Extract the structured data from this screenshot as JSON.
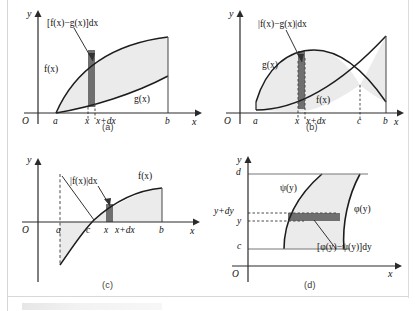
{
  "figure": {
    "panels": [
      {
        "id": "a",
        "caption": "(a)",
        "axes": {
          "y": "y",
          "x": "x",
          "origin": "O"
        },
        "ticks": [
          "a",
          "x",
          "x+dx",
          "b"
        ],
        "curve_labels": [
          "f(x)",
          "g(x)"
        ],
        "strip_label": "[f(x)−g(x)]dx"
      },
      {
        "id": "b",
        "caption": "(b)",
        "axes": {
          "y": "y",
          "x": "x",
          "origin": "O"
        },
        "ticks": [
          "a",
          "x",
          "x+dx",
          "c",
          "b"
        ],
        "curve_labels": [
          "g(x)",
          "f(x)"
        ],
        "strip_label": "|f(x)−g(x)|dx"
      },
      {
        "id": "c",
        "caption": "(c)",
        "axes": {
          "y": "y",
          "x": "x",
          "origin": "O"
        },
        "ticks": [
          "a",
          "c",
          "x",
          "x+dx",
          "b"
        ],
        "curve_labels": [
          "f(x)"
        ],
        "strip_label": "|f(x)|dx"
      },
      {
        "id": "d",
        "caption": "(d)",
        "axes": {
          "y": "y",
          "x": "x",
          "origin": "O"
        },
        "ticks": [
          "d",
          "y+dy",
          "y",
          "c"
        ],
        "curve_labels": [
          "ψ(y)",
          "φ(y)"
        ],
        "strip_label": "[φ(y)−ψ(y)]dy"
      }
    ],
    "colors": {
      "region_fill": "#ebebeb",
      "strip_fill": "#6f6f6f",
      "curve_stroke": "#1d1d1d",
      "axis_stroke": "#2a2a2a",
      "dash_stroke": "#4a4a4a",
      "page_background": "#ffffff"
    }
  }
}
